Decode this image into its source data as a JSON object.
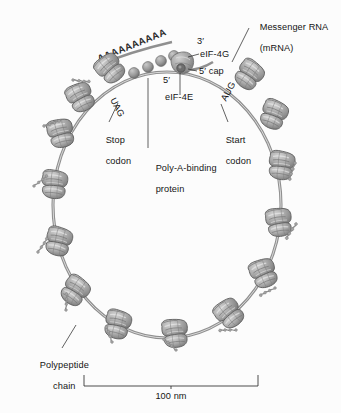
{
  "figure": {
    "type": "biology-diagram",
    "background_color": "#fcfcfc",
    "ink_color": "#4a4a4a",
    "ribosome_fill": "#9d9d9d",
    "text_color": "#151515"
  },
  "labels": {
    "messenger_rna_line1": "Messenger RNA",
    "messenger_rna_line2": "(mRNA)",
    "eif4g": "eIF-4G",
    "eif4e": "eIF-4E",
    "five_prime_cap": "5′ cap",
    "five_prime": "5′",
    "three_prime": "3′",
    "poly_a_binding_line1": "Poly-A-binding",
    "poly_a_binding_line2": "protein",
    "stop_codon_line1": "Stop",
    "stop_codon_line2": "codon",
    "stop_codon_triplet": "UAG",
    "start_codon_line1": "Start",
    "start_codon_line2": "codon",
    "start_codon_triplet": "AUG",
    "polypeptide_line1": "Polypeptide",
    "polypeptide_line2": "chain",
    "scale_bar_label": "100 nm",
    "poly_a_tail": "AAAAAAAAAA"
  },
  "scale_bar": {
    "value": 100,
    "unit": "nm",
    "text": "100 nm"
  },
  "structures": {
    "ribosome_count": 14,
    "poly_a_binding_protein_count": 4,
    "mrna_shape": "circle",
    "polypeptide_chain_count": 9
  }
}
